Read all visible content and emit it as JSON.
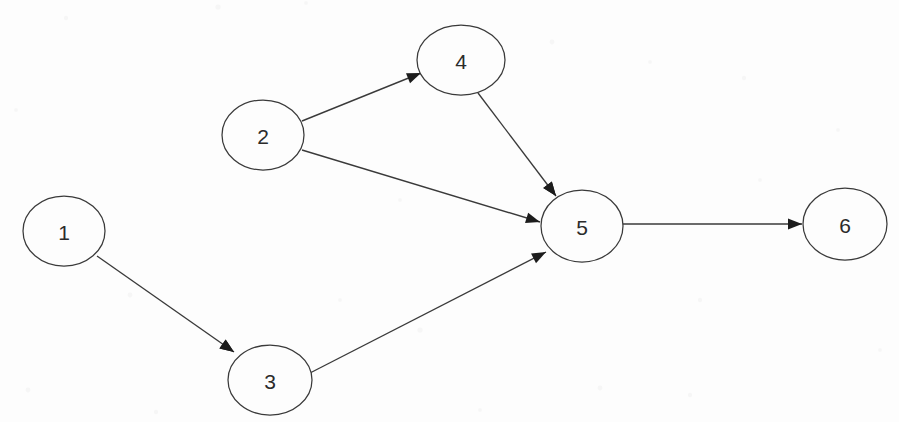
{
  "figure": {
    "title": "",
    "background_color": "#fdfdfd",
    "node_fill": "#fdfdfd",
    "node_stroke": "#3a3a3a",
    "edge_stroke": "#3a3a3a",
    "label_color": "#2b2b2b",
    "width": 899,
    "height": 422
  },
  "graph": {
    "type": "directed-graph",
    "node_count": 6,
    "edge_count": 6,
    "nodes": [
      {
        "id": "1",
        "label": "1",
        "cx": 64,
        "cy": 231,
        "rx": 41,
        "ry": 35
      },
      {
        "id": "2",
        "label": "2",
        "cx": 263,
        "cy": 135,
        "rx": 41,
        "ry": 35
      },
      {
        "id": "3",
        "label": "3",
        "cx": 270,
        "cy": 380,
        "rx": 42,
        "ry": 35
      },
      {
        "id": "4",
        "label": "4",
        "cx": 461,
        "cy": 60,
        "rx": 44,
        "ry": 35
      },
      {
        "id": "5",
        "label": "5",
        "cx": 582,
        "cy": 226,
        "rx": 41,
        "ry": 36
      },
      {
        "id": "6",
        "label": "6",
        "cx": 845,
        "cy": 224,
        "rx": 42,
        "ry": 36
      }
    ],
    "edges": [
      {
        "from": "1",
        "to": "3",
        "x1": 97,
        "y1": 256,
        "x2": 234,
        "y2": 352,
        "directed": true
      },
      {
        "from": "2",
        "to": "4",
        "x1": 302,
        "y1": 121,
        "x2": 421,
        "y2": 73,
        "directed": true
      },
      {
        "from": "2",
        "to": "5",
        "x1": 302,
        "y1": 150,
        "x2": 540,
        "y2": 222,
        "directed": true
      },
      {
        "from": "4",
        "to": "5",
        "x1": 478,
        "y1": 93,
        "x2": 556,
        "y2": 196,
        "directed": true
      },
      {
        "from": "3",
        "to": "5",
        "x1": 310,
        "y1": 373,
        "x2": 546,
        "y2": 252,
        "directed": true
      },
      {
        "from": "5",
        "to": "6",
        "x1": 623,
        "y1": 224,
        "x2": 802,
        "y2": 224,
        "directed": true
      }
    ]
  },
  "node_labels": {
    "n1": "1",
    "n2": "2",
    "n3": "3",
    "n4": "4",
    "n5": "5",
    "n6": "6"
  }
}
